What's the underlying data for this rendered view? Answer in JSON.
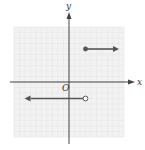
{
  "chart_data": {
    "type": "line",
    "title": "",
    "xlabel": "x",
    "ylabel": "y",
    "origin_label": "O",
    "xlim": [
      -10,
      10
    ],
    "ylim": [
      -10,
      10
    ],
    "grid": true,
    "series": [
      {
        "name": "upper-ray",
        "start": {
          "x": 3,
          "y": 6,
          "endpoint": "closed"
        },
        "direction": "right",
        "end_x": 8
      },
      {
        "name": "lower-ray",
        "start": {
          "x": 3,
          "y": -3,
          "endpoint": "open"
        },
        "direction": "left",
        "end_x": -7
      }
    ],
    "colors": {
      "grid": "#e6e6e6",
      "grid_bg": "#f2f2f2",
      "axis": "#444444",
      "ray": "#555555"
    }
  }
}
